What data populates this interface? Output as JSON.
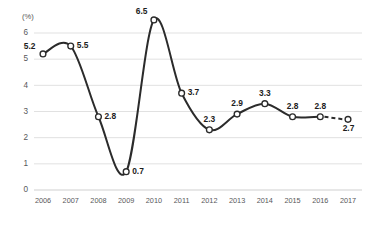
{
  "chart_data": {
    "type": "line",
    "title": "",
    "subtitle": "",
    "xlabel": "",
    "ylabel": "",
    "unit_label": "(%)",
    "categories": [
      "2006",
      "2007",
      "2008",
      "2009",
      "2010",
      "2011",
      "2012",
      "2013",
      "2014",
      "2015",
      "2016",
      "2017"
    ],
    "values": [
      5.2,
      5.5,
      2.8,
      0.7,
      6.5,
      3.7,
      2.3,
      2.9,
      3.3,
      2.8,
      2.8,
      2.7
    ],
    "point_labels": [
      "5.2",
      "5.5",
      "2.8",
      "0.7",
      "6.5",
      "3.7",
      "2.3",
      "2.9",
      "3.3",
      "2.8",
      "2.8",
      "2.7"
    ],
    "label_positions": [
      "left",
      "right",
      "right",
      "right",
      "above-left",
      "right",
      "above",
      "above",
      "above",
      "above",
      "above",
      "below"
    ],
    "ylim": [
      0,
      6
    ],
    "yticks": [
      0,
      1,
      2,
      3,
      4,
      5,
      6
    ],
    "ytick_labels": [
      "0",
      "1",
      "2",
      "3",
      "4",
      "5",
      "6"
    ],
    "grid": true,
    "legend": "none",
    "dashed_from_index": 10,
    "dashed_note": "2016 to 2017 segment drawn dashed",
    "series": [
      {
        "name": "",
        "values": [
          5.2,
          5.5,
          2.8,
          0.7,
          6.5,
          3.7,
          2.3,
          2.9,
          3.3,
          2.8,
          2.8,
          2.7
        ]
      }
    ],
    "colors": {
      "line": "#2b2b2b",
      "marker_fill": "#ffffff",
      "marker_stroke": "#2b2b2b",
      "grid": "#d9d9d9",
      "tick_text": "#58585a",
      "label_text": "#1d1d1d",
      "background": "#ffffff"
    }
  }
}
